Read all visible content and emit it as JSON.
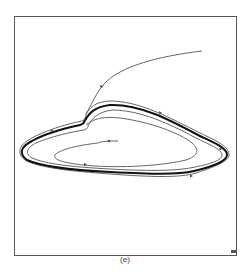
{
  "figure": {
    "caption": "(e)",
    "type": "phase-portrait"
  },
  "colors": {
    "background": "#ffffff",
    "frame": "#555555",
    "trajectory": "#555555",
    "limit_cycle": "#111111"
  },
  "elements": {
    "frame": "plot-frame",
    "limit_cycle": "limit-cycle",
    "outer_trajectory": "incoming-trajectory-outside",
    "outer_envelope": "outer-approaching-orbit",
    "inner_envelope": "inner-approaching-orbit",
    "inner_spiral": "inner-spiral-trajectory"
  }
}
